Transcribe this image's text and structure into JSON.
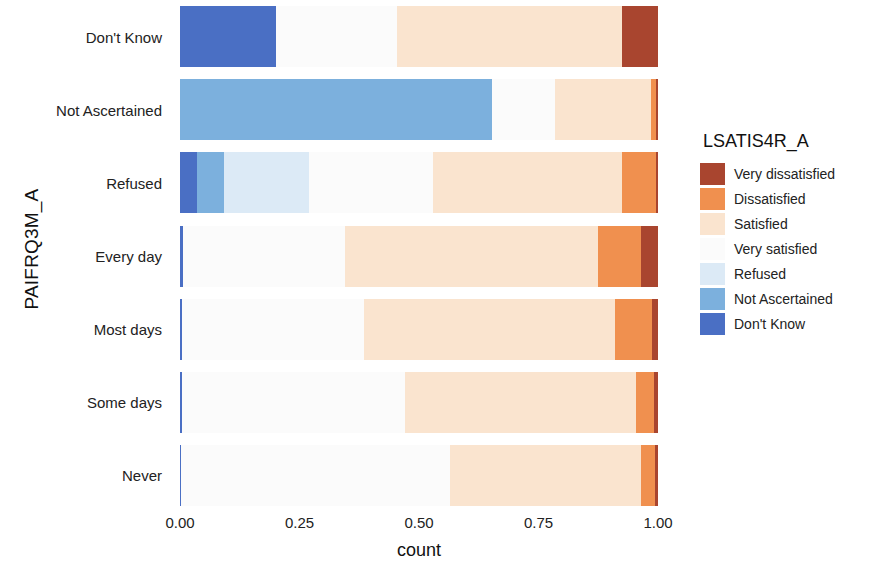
{
  "chart_data": {
    "type": "bar",
    "orientation": "horizontal",
    "stacked": true,
    "normalized": true,
    "title": "",
    "xlabel": "count",
    "ylabel": "PAIFRQ3M_A",
    "xlim": [
      0,
      1
    ],
    "xticks": [
      "0.00",
      "0.25",
      "0.50",
      "0.75",
      "1.00"
    ],
    "xtick_values": [
      0.0,
      0.25,
      0.5,
      0.75,
      1.0
    ],
    "grid": false,
    "legend_position": "right",
    "legend_title": "LSATIS4R_A",
    "categories": [
      "Don't Know",
      "Not Ascertained",
      "Refused",
      "Every day",
      "Most days",
      "Some days",
      "Never"
    ],
    "series": [
      {
        "name": "Very dissatisfied",
        "color": "#a9452f",
        "values": [
          0.075,
          0.005,
          0.004,
          0.035,
          0.012,
          0.008,
          0.006
        ]
      },
      {
        "name": "Dissatisfied",
        "color": "#f0904f",
        "values": [
          0.0,
          0.01,
          0.071,
          0.09,
          0.078,
          0.037,
          0.029
        ]
      },
      {
        "name": "Satisfied",
        "color": "#fae4cf",
        "values": [
          0.47,
          0.2,
          0.395,
          0.53,
          0.525,
          0.485,
          0.4
        ]
      },
      {
        "name": "Very satisfied",
        "color": "#fbfbfb",
        "values": [
          0.255,
          0.132,
          0.26,
          0.338,
          0.38,
          0.466,
          0.562
        ]
      },
      {
        "name": "Refused",
        "color": "#dceaf6",
        "values": [
          0.0,
          0.0,
          0.178,
          0.0,
          0.0,
          0.0,
          0.0
        ]
      },
      {
        "name": "Not Ascertained",
        "color": "#7cb0dd",
        "values": [
          0.0,
          0.653,
          0.057,
          0.0,
          0.0,
          0.0,
          0.0
        ]
      },
      {
        "name": "Don't Know",
        "color": "#4a6fc4",
        "values": [
          0.2,
          0.0,
          0.035,
          0.007,
          0.005,
          0.004,
          0.003
        ]
      }
    ]
  },
  "legend": {
    "title": "LSATIS4R_A",
    "items": [
      {
        "label": "Very dissatisfied",
        "color": "#a9452f"
      },
      {
        "label": "Dissatisfied",
        "color": "#f0904f"
      },
      {
        "label": "Satisfied",
        "color": "#fae4cf"
      },
      {
        "label": "Very satisfied",
        "color": "#fbfbfb"
      },
      {
        "label": "Refused",
        "color": "#dceaf6"
      },
      {
        "label": "Not Ascertained",
        "color": "#7cb0dd"
      },
      {
        "label": "Don't Know",
        "color": "#4a6fc4"
      }
    ]
  },
  "axes": {
    "x_title": "count",
    "y_title": "PAIFRQ3M_A"
  }
}
